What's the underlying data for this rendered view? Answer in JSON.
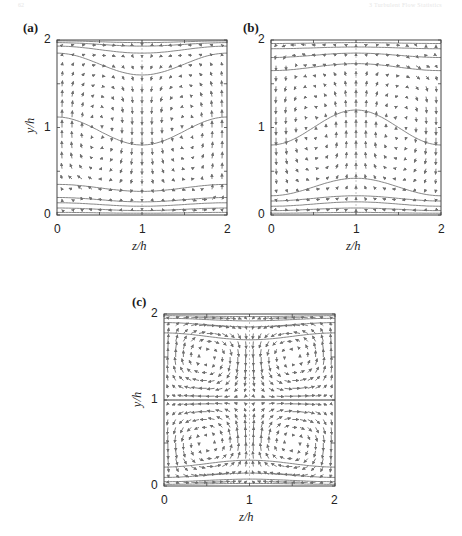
{
  "page_header": {
    "left": "62",
    "right": "3  Turbulent Flow Statistics"
  },
  "chart_data": [
    {
      "id": "a",
      "type": "quiver",
      "panel_label": "(a)",
      "xlabel": "z/h",
      "ylabel": "y/h",
      "xlim": [
        0,
        2
      ],
      "ylim": [
        0,
        2
      ],
      "xticks": [
        "0",
        "1",
        "2"
      ],
      "yticks": [
        "0",
        "1",
        "2"
      ],
      "grid": false,
      "description": "Secondary-flow vectors with streamwise-velocity contours; upward flow near side walls, downward flow along centerline z/h=1",
      "flow_pattern": "side_up_center_down",
      "contour_levels_y_at_center": [
        0.02,
        0.05,
        0.1,
        0.15,
        0.27,
        0.8,
        1.6,
        1.85,
        1.93,
        1.97
      ],
      "contour_levels_y_at_wall": [
        0.03,
        0.08,
        0.14,
        0.2,
        0.35,
        1.12,
        1.85,
        1.93,
        1.97,
        1.99
      ]
    },
    {
      "id": "b",
      "type": "quiver",
      "panel_label": "(b)",
      "xlabel": "z/h",
      "ylabel": "",
      "xlim": [
        0,
        2
      ],
      "ylim": [
        0,
        2
      ],
      "xticks": [
        "0",
        "1",
        "2"
      ],
      "yticks": [
        "0",
        "1",
        "2"
      ],
      "grid": false,
      "description": "Secondary-flow vectors with streamwise-velocity contours; downward flow near side walls, upward flow along centerline z/h=1",
      "flow_pattern": "side_down_center_up",
      "contour_levels_y_at_center": [
        0.03,
        0.08,
        0.15,
        0.22,
        0.42,
        1.2,
        1.73,
        1.85,
        1.92,
        1.97
      ],
      "contour_levels_y_at_wall": [
        0.02,
        0.05,
        0.1,
        0.16,
        0.22,
        0.8,
        1.65,
        1.8,
        1.9,
        1.96
      ]
    },
    {
      "id": "c",
      "type": "quiver",
      "panel_label": "(c)",
      "xlabel": "z/h",
      "ylabel": "y/h",
      "xlim": [
        0,
        2
      ],
      "ylim": [
        0,
        2
      ],
      "xticks": [
        "0",
        "1",
        "2"
      ],
      "yticks": [
        "0",
        "1",
        "2"
      ],
      "grid": false,
      "description": "Four symmetric counter-rotating secondary vortices, one in each quadrant; flat contour at y/h=1",
      "flow_pattern": "four_vortices",
      "contour_levels_y_at_center": [
        0.03,
        0.08,
        0.15,
        0.3,
        1.0,
        1.7,
        1.85,
        1.92,
        1.97
      ],
      "contour_levels_y_at_wall": [
        0.02,
        0.05,
        0.1,
        0.22,
        1.0,
        1.78,
        1.9,
        1.95,
        1.98
      ]
    }
  ],
  "style": {
    "arrow_color": "#6e6e6e",
    "contour_color": "#7a7a7a",
    "axis_color": "#444444"
  }
}
